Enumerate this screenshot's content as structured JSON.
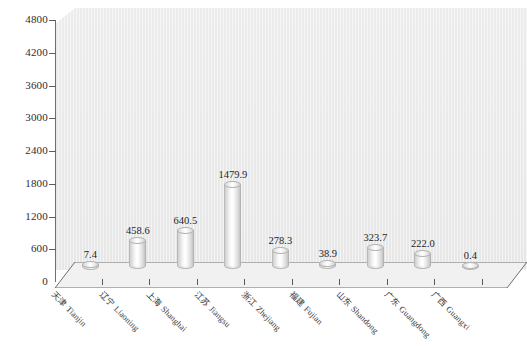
{
  "chart_data": {
    "type": "bar",
    "title": "",
    "subtitle": "",
    "xlabel": "",
    "ylabel": "",
    "ylim": [
      0,
      4800
    ],
    "ytick_step": 600,
    "yticks": [
      "4800",
      "4200",
      "3600",
      "3000",
      "2400",
      "1800",
      "1200",
      "600",
      "0"
    ],
    "ytick_values": [
      4800,
      4200,
      3600,
      3000,
      2400,
      1800,
      1200,
      600,
      0
    ],
    "grid": false,
    "legend": "none",
    "style": "3d-cylinder",
    "categories": [
      "天津 Tianjin",
      "辽宁 Liaoning",
      "上海 Shanghai",
      "江苏 Jiangsu",
      "浙江 Zhejiang",
      "福建 Fujian",
      "山东 Shandong",
      "广东 Guangdong",
      "广西 Guangxi"
    ],
    "values": [
      7.4,
      458.6,
      640.5,
      1479.9,
      278.3,
      38.9,
      323.7,
      222.0,
      0.4
    ],
    "value_labels": [
      "7.4",
      "458.6",
      "640.5",
      "1479.9",
      "278.3",
      "38.9",
      "323.7",
      "222.0",
      "0.4"
    ],
    "colors": {
      "plot_background": "#eaeaea",
      "bar_fill": "#f2f2f2",
      "bar_edge": "#b6b6b6",
      "axis": "#5d5d5d",
      "text": "#2e2e2e",
      "page_background": "#ffffff",
      "floor": "#f0f0f0"
    }
  }
}
